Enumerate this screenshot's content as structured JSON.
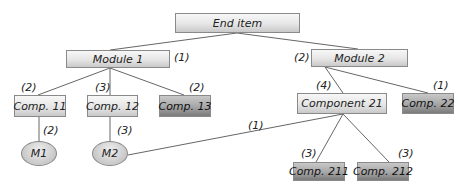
{
  "diagram": {
    "type": "product-structure-tree",
    "nodes": {
      "end_item": "End item",
      "module1": "Module 1",
      "module2": "Module 2",
      "comp11": "Comp. 11",
      "comp12": "Comp. 12",
      "comp13": "Comp. 13",
      "component21": "Component 21",
      "comp22": "Comp. 22",
      "m1": "M1",
      "m2": "M2",
      "comp211": "Comp. 211",
      "comp212": "Comp. 212"
    },
    "quantities": {
      "module1": "(1)",
      "module2": "(2)",
      "comp11": "(2)",
      "comp12": "(3)",
      "comp13": "(2)",
      "component21": "(4)",
      "comp22": "(1)",
      "m1": "(2)",
      "m2_from_comp12": "(3)",
      "m2_from_component21": "(1)",
      "comp211": "(3)",
      "comp212": "(3)"
    },
    "edges": [
      [
        "End item",
        "Module 1"
      ],
      [
        "End item",
        "Module 2"
      ],
      [
        "Module 1",
        "Comp. 11"
      ],
      [
        "Module 1",
        "Comp. 12"
      ],
      [
        "Module 1",
        "Comp. 13"
      ],
      [
        "Module 2",
        "Component 21"
      ],
      [
        "Module 2",
        "Comp. 22"
      ],
      [
        "Comp. 11",
        "M1"
      ],
      [
        "Comp. 12",
        "M2"
      ],
      [
        "Component 21",
        "M2"
      ],
      [
        "Component 21",
        "Comp. 211"
      ],
      [
        "Component 21",
        "Comp. 212"
      ]
    ],
    "colors": {
      "light_box": "#e6e6e6",
      "dark_box": "#a6a6a6",
      "line": "#666666"
    }
  }
}
